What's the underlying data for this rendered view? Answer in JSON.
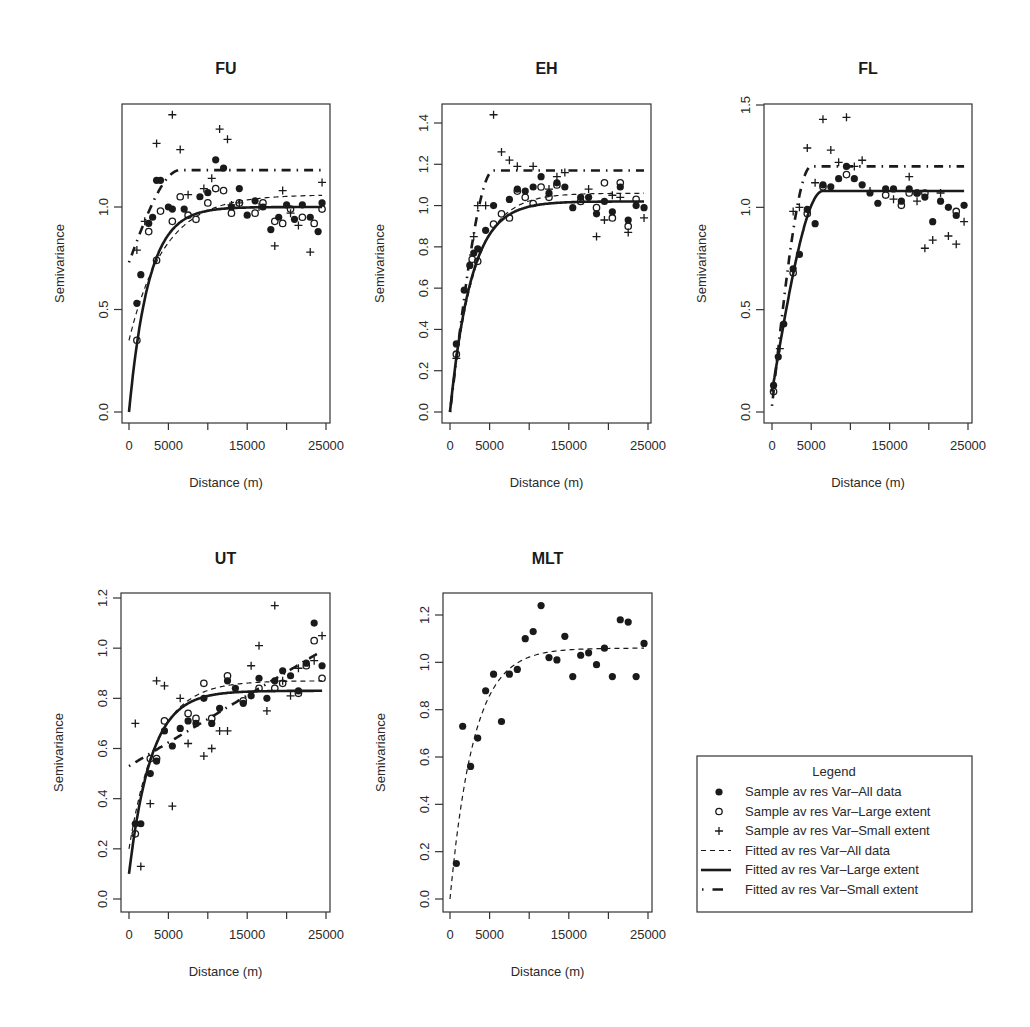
{
  "chart_data": [
    {
      "type": "scatter",
      "title": "FU",
      "xlabel": "Distance (m)",
      "ylabel": "Semivariance",
      "xlim": [
        0,
        25000
      ],
      "ylim": [
        0,
        1.5
      ],
      "xticks": [
        0,
        5000,
        10000,
        15000,
        20000,
        25000
      ],
      "xtick_labels": [
        "0",
        "5000",
        "",
        "15000",
        "",
        "25000"
      ],
      "yticks": [
        0.0,
        0.5,
        1.0
      ],
      "ytick_labels": [
        "0.0",
        "0.5",
        "1.0"
      ],
      "series": [
        {
          "name": "Sample av res Var-All data",
          "marker": "filled-circle",
          "x": [
            1000,
            1500,
            2500,
            3000,
            3500,
            4000,
            5000,
            5500,
            7000,
            9000,
            10000,
            11000,
            12000,
            13000,
            14000,
            15000,
            16000,
            17000,
            18000,
            19000,
            20000,
            21000,
            22000,
            23000,
            24000,
            24500
          ],
          "y": [
            0.53,
            0.67,
            0.92,
            0.95,
            1.13,
            1.13,
            1.0,
            0.99,
            0.99,
            1.05,
            1.07,
            1.23,
            1.19,
            1.0,
            1.09,
            0.96,
            1.03,
            1.0,
            0.89,
            0.95,
            1.01,
            0.94,
            1.01,
            0.95,
            0.88,
            1.02
          ]
        },
        {
          "name": "Sample av res Var-Large extent",
          "marker": "open-circle",
          "x": [
            1000,
            2500,
            3500,
            4000,
            5500,
            6500,
            7500,
            8500,
            10000,
            11000,
            12000,
            13000,
            14000,
            16000,
            17000,
            18500,
            19500,
            20500,
            22000,
            23500,
            24500
          ],
          "y": [
            0.35,
            0.88,
            0.74,
            0.98,
            0.93,
            1.05,
            0.96,
            0.94,
            1.02,
            1.09,
            1.08,
            0.97,
            1.02,
            0.97,
            1.02,
            0.93,
            0.92,
            0.99,
            0.95,
            0.92,
            0.99
          ],
          "note": "values approximate"
        },
        {
          "name": "Sample av res Var-Small extent",
          "marker": "plus",
          "x": [
            1000,
            2000,
            3500,
            5500,
            6500,
            7500,
            9500,
            10500,
            11500,
            12500,
            13000,
            14000,
            16500,
            18500,
            19500,
            20500,
            21500,
            23000,
            24500
          ],
          "y": [
            0.79,
            0.93,
            1.31,
            1.45,
            1.28,
            1.06,
            1.09,
            1.14,
            1.38,
            1.33,
            1.01,
            1.02,
            1.0,
            0.81,
            1.08,
            0.97,
            0.91,
            0.78,
            1.12
          ]
        }
      ],
      "fitted": [
        {
          "name": "Fitted av res Var-All data",
          "style": "dashed",
          "nugget": 0.35,
          "sill": 1.06,
          "range": 4500,
          "model": "exponential"
        },
        {
          "name": "Fitted av res Var-Large extent",
          "style": "solid",
          "nugget": 0.0,
          "sill": 1.0,
          "range": 2500,
          "model": "exponential"
        },
        {
          "name": "Fitted av res Var-Small extent",
          "style": "dotdash",
          "nugget": 0.73,
          "sill": 1.18,
          "range": 6500,
          "model": "spherical"
        }
      ]
    },
    {
      "type": "scatter",
      "title": "EH",
      "xlabel": "Distance (m)",
      "ylabel": "Semivariance",
      "xlim": [
        0,
        25000
      ],
      "ylim": [
        0,
        1.45
      ],
      "xticks": [
        0,
        5000,
        10000,
        15000,
        20000,
        25000
      ],
      "xtick_labels": [
        "0",
        "5000",
        "",
        "15000",
        "",
        "25000"
      ],
      "yticks": [
        0.0,
        0.2,
        0.4,
        0.6,
        0.8,
        1.0,
        1.2,
        1.4
      ],
      "ytick_labels": [
        "0.0",
        "0.2",
        "0.4",
        "0.6",
        "0.8",
        "1.0",
        "1.2",
        "1.4"
      ],
      "series": [
        {
          "name": "Sample av res Var-All data",
          "marker": "filled-circle",
          "x": [
            800,
            1800,
            2500,
            3000,
            3500,
            4500,
            5500,
            7500,
            8500,
            9500,
            10500,
            11500,
            12500,
            13500,
            14500,
            15500,
            16500,
            17500,
            18500,
            19500,
            20500,
            21500,
            22500,
            23500,
            24500
          ],
          "y": [
            0.33,
            0.59,
            0.71,
            0.77,
            0.79,
            0.88,
            1.0,
            1.03,
            1.08,
            1.07,
            1.09,
            1.14,
            1.06,
            1.11,
            1.09,
            0.99,
            1.04,
            1.04,
            0.96,
            1.02,
            0.97,
            1.09,
            0.93,
            1.0,
            0.99
          ]
        },
        {
          "name": "Sample av res Var-Large extent",
          "marker": "open-circle",
          "x": [
            800,
            2800,
            3500,
            5500,
            6500,
            7500,
            8500,
            9500,
            10500,
            11500,
            12500,
            13500,
            16500,
            18500,
            19500,
            20500,
            21500,
            22500,
            23500
          ],
          "y": [
            0.28,
            0.74,
            0.73,
            0.91,
            0.96,
            0.94,
            1.07,
            1.04,
            1.01,
            1.09,
            1.04,
            1.1,
            1.02,
            0.99,
            1.11,
            0.94,
            1.11,
            0.9,
            1.03
          ]
        },
        {
          "name": "Sample av res Var-Small extent",
          "marker": "plus",
          "x": [
            800,
            3000,
            3500,
            4500,
            5500,
            6500,
            7500,
            8500,
            10500,
            12500,
            13500,
            14500,
            17500,
            18500,
            19500,
            20500,
            21500,
            22500,
            24500
          ],
          "y": [
            0.26,
            0.85,
            1.0,
            1.0,
            1.44,
            1.26,
            1.22,
            1.19,
            1.19,
            1.08,
            1.14,
            1.16,
            1.08,
            0.85,
            0.93,
            1.05,
            1.04,
            0.87,
            0.94
          ]
        }
      ],
      "fitted": [
        {
          "name": "Fitted av res Var-All data",
          "style": "dashed",
          "nugget": 0.0,
          "sill": 1.06,
          "range": 3000,
          "model": "exponential"
        },
        {
          "name": "Fitted av res Var-Large extent",
          "style": "solid",
          "nugget": 0.0,
          "sill": 1.02,
          "range": 2700,
          "model": "exponential"
        },
        {
          "name": "Fitted av res Var-Small extent",
          "style": "dotdash",
          "nugget": 0.0,
          "sill": 1.17,
          "range": 5500,
          "model": "spherical"
        }
      ]
    },
    {
      "type": "scatter",
      "title": "FL",
      "xlabel": "Distance (m)",
      "ylabel": "Semivariance",
      "xlim": [
        0,
        25000
      ],
      "ylim": [
        0,
        1.5
      ],
      "xticks": [
        0,
        5000,
        10000,
        15000,
        20000,
        25000
      ],
      "xtick_labels": [
        "0",
        "5000",
        "",
        "15000",
        "",
        "25000"
      ],
      "yticks": [
        0.0,
        0.5,
        1.0,
        1.5
      ],
      "ytick_labels": [
        "0.0",
        "0.5",
        "1.0",
        "1.5"
      ],
      "series": [
        {
          "name": "Sample av res Var-All data",
          "marker": "filled-circle",
          "x": [
            200,
            800,
            1500,
            2700,
            3500,
            4500,
            5500,
            6500,
            7500,
            8500,
            9500,
            10500,
            11500,
            12500,
            13500,
            14500,
            15500,
            16500,
            17500,
            18500,
            19500,
            20500,
            21500,
            22500,
            23500,
            24500
          ],
          "y": [
            0.13,
            0.27,
            0.43,
            0.7,
            0.77,
            0.99,
            0.92,
            1.11,
            1.1,
            1.14,
            1.2,
            1.14,
            1.11,
            1.07,
            1.02,
            1.09,
            1.09,
            1.03,
            1.09,
            1.07,
            1.05,
            0.93,
            1.03,
            1.0,
            0.96,
            1.01
          ]
        },
        {
          "name": "Sample av res Var-Large extent",
          "marker": "open-circle",
          "x": [
            200,
            2700,
            4500,
            6500,
            9500,
            14500,
            16500,
            17500,
            18500,
            19500,
            23500
          ],
          "y": [
            0.1,
            0.68,
            0.97,
            1.1,
            1.16,
            1.06,
            1.01,
            1.07,
            1.07,
            1.07,
            0.98
          ]
        },
        {
          "name": "Sample av res Var-Small extent",
          "marker": "plus",
          "x": [
            1000,
            2700,
            3500,
            4500,
            5500,
            6500,
            7500,
            8500,
            9500,
            10500,
            11500,
            12500,
            15500,
            17500,
            18500,
            19500,
            20500,
            21500,
            22500,
            23500,
            24500
          ],
          "y": [
            0.31,
            0.98,
            1.0,
            1.29,
            1.12,
            1.43,
            1.28,
            1.22,
            1.44,
            1.2,
            1.23,
            1.08,
            1.04,
            1.15,
            1.03,
            0.8,
            0.84,
            1.07,
            0.86,
            0.82,
            0.93
          ]
        }
      ],
      "fitted": [
        {
          "name": "Fitted av res Var-All data",
          "style": "dashed",
          "nugget": 0.1,
          "sill": 1.08,
          "range": 6500,
          "model": "spherical"
        },
        {
          "name": "Fitted av res Var-Large extent",
          "style": "solid",
          "nugget": 0.1,
          "sill": 1.08,
          "range": 6500,
          "model": "spherical"
        },
        {
          "name": "Fitted av res Var-Small extent",
          "style": "dotdash",
          "nugget": 0.03,
          "sill": 1.2,
          "range": 5000,
          "model": "spherical"
        }
      ]
    },
    {
      "type": "scatter",
      "title": "UT",
      "xlabel": "Distance (m)",
      "ylabel": "Semivariance",
      "xlim": [
        0,
        25000
      ],
      "ylim": [
        0,
        1.25
      ],
      "xticks": [
        0,
        5000,
        10000,
        15000,
        20000,
        25000
      ],
      "xtick_labels": [
        "0",
        "5000",
        "",
        "15000",
        "",
        "25000"
      ],
      "yticks": [
        0.0,
        0.2,
        0.4,
        0.6,
        0.8,
        1.0,
        1.2
      ],
      "ytick_labels": [
        "0.0",
        "0.2",
        "0.4",
        "0.6",
        "0.8",
        "1.0",
        "1.2"
      ],
      "series": [
        {
          "name": "Sample av res Var-All data",
          "marker": "filled-circle",
          "x": [
            800,
            1500,
            2700,
            3500,
            4500,
            5500,
            6500,
            7500,
            8500,
            9500,
            10500,
            11500,
            12500,
            13500,
            14500,
            15500,
            16500,
            17500,
            18500,
            19500,
            20500,
            21500,
            22500,
            23500,
            24500
          ],
          "y": [
            0.3,
            0.3,
            0.5,
            0.55,
            0.67,
            0.61,
            0.68,
            0.71,
            0.7,
            0.8,
            0.7,
            0.76,
            0.87,
            0.84,
            0.78,
            0.81,
            0.88,
            0.8,
            0.87,
            0.91,
            0.89,
            0.83,
            0.94,
            1.1,
            0.93
          ]
        },
        {
          "name": "Sample av res Var-Large extent",
          "marker": "open-circle",
          "x": [
            800,
            2700,
            3500,
            4500,
            7500,
            8500,
            9500,
            10500,
            12500,
            14500,
            16500,
            18500,
            19500,
            21500,
            22500,
            23500,
            24500
          ],
          "y": [
            0.26,
            0.56,
            0.56,
            0.71,
            0.74,
            0.72,
            0.86,
            0.72,
            0.89,
            0.79,
            0.84,
            0.84,
            0.86,
            0.82,
            0.93,
            1.03,
            0.88
          ]
        },
        {
          "name": "Sample av res Var-Small extent",
          "marker": "plus",
          "x": [
            800,
            1500,
            2700,
            3500,
            4500,
            5500,
            6500,
            7500,
            9500,
            10500,
            11500,
            12500,
            15500,
            16500,
            17500,
            18500,
            19500,
            20500,
            21500,
            23500,
            24500
          ],
          "y": [
            0.7,
            0.13,
            0.38,
            0.87,
            0.85,
            0.37,
            0.8,
            0.62,
            0.57,
            0.6,
            0.67,
            0.67,
            0.93,
            1.01,
            0.75,
            1.17,
            0.87,
            0.81,
            0.92,
            0.95,
            1.05
          ]
        }
      ],
      "fitted": [
        {
          "name": "Fitted av res Var-All data",
          "style": "dashed",
          "nugget": 0.2,
          "sill": 0.87,
          "range": 3500,
          "model": "exponential"
        },
        {
          "name": "Fitted av res Var-Large extent",
          "style": "solid",
          "nugget": 0.1,
          "sill": 0.83,
          "range": 2800,
          "model": "exponential"
        },
        {
          "name": "Fitted av res Var-Small extent",
          "style": "dotdash",
          "nugget": 0.53,
          "sill": 0.98,
          "range": 24000,
          "model": "linear"
        }
      ]
    },
    {
      "type": "scatter",
      "title": "MLT",
      "xlabel": "Distance (m)",
      "ylabel": "Semivariance",
      "xlim": [
        0,
        25000
      ],
      "ylim": [
        0,
        1.3
      ],
      "xticks": [
        0,
        5000,
        10000,
        15000,
        20000,
        25000
      ],
      "xtick_labels": [
        "0",
        "5000",
        "",
        "15000",
        "",
        "25000"
      ],
      "yticks": [
        0.0,
        0.2,
        0.4,
        0.6,
        0.8,
        1.0,
        1.2
      ],
      "ytick_labels": [
        "0.0",
        "0.2",
        "0.4",
        "0.6",
        "0.8",
        "1.0",
        "1.2"
      ],
      "series": [
        {
          "name": "Sample av res Var-All data",
          "marker": "filled-circle",
          "x": [
            800,
            1600,
            2600,
            3500,
            4500,
            5500,
            6500,
            7500,
            8500,
            9500,
            10500,
            11500,
            12500,
            13500,
            14500,
            15500,
            16500,
            17500,
            18500,
            19500,
            20500,
            21500,
            22500,
            23500,
            24500
          ],
          "y": [
            0.15,
            0.73,
            0.56,
            0.68,
            0.88,
            0.95,
            0.75,
            0.95,
            0.97,
            1.1,
            1.13,
            1.24,
            1.02,
            1.01,
            1.11,
            0.94,
            1.03,
            1.04,
            0.99,
            1.06,
            0.94,
            1.18,
            1.17,
            0.94,
            1.08
          ]
        }
      ],
      "fitted": [
        {
          "name": "Fitted av res Var-All data",
          "style": "dashed",
          "nugget": 0.0,
          "sill": 1.06,
          "range": 3000,
          "model": "exponential"
        }
      ]
    }
  ],
  "legend": {
    "title": "Legend",
    "items": [
      {
        "marker": "filled-circle",
        "label": "Sample av res Var–All data"
      },
      {
        "marker": "open-circle",
        "label": "Sample av res Var–Large extent"
      },
      {
        "marker": "plus",
        "label": "Sample av res Var–Small extent"
      },
      {
        "marker": "dashed-line",
        "label": "Fitted av res Var–All data"
      },
      {
        "marker": "solid-line",
        "label": "Fitted av res Var–Large extent"
      },
      {
        "marker": "dotdash-line",
        "label": "Fitted av res Var–Small extent"
      }
    ]
  },
  "colors": {
    "ink": "#1a1a1a",
    "axis": "#333333",
    "background": "#ffffff"
  }
}
